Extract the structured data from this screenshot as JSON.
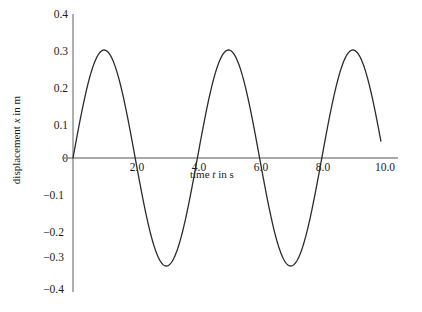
{
  "chart_data": {
    "type": "line",
    "title": "",
    "xlabel": "time t in s",
    "ylabel": "displacement x in m",
    "xlim": [
      0,
      10.4
    ],
    "ylim": [
      -0.4,
      0.4
    ],
    "grid": false,
    "legend": "none",
    "x_ticks": [
      "2.0",
      "4.0",
      "6.0",
      "8.0",
      "10.0"
    ],
    "x_tick_values": [
      2.0,
      4.0,
      6.0,
      8.0,
      10.0
    ],
    "y_ticks": [
      "0.4",
      "0.3",
      "0.2",
      "0.1",
      "0",
      "−0.1",
      "−0.2",
      "−0.3",
      "−0.4"
    ],
    "y_tick_values": [
      0.4,
      0.3,
      0.2,
      0.1,
      0,
      -0.1,
      -0.2,
      -0.3,
      -0.4
    ],
    "series": [
      {
        "name": "displacement",
        "amplitude": 0.3,
        "period": 4.0,
        "equation": "x = 0.3 sin(2πt/4)",
        "x": [
          0.0,
          0.25,
          0.5,
          0.75,
          1.0,
          1.25,
          1.5,
          1.75,
          2.0,
          2.25,
          2.5,
          2.75,
          3.0,
          3.25,
          3.5,
          3.75,
          4.0,
          4.25,
          4.5,
          4.75,
          5.0,
          5.25,
          5.5,
          5.75,
          6.0,
          6.25,
          6.5,
          6.75,
          7.0,
          7.25,
          7.5,
          7.75,
          8.0,
          8.25,
          8.5,
          8.75,
          9.0,
          9.25,
          9.5,
          9.75,
          9.9
        ],
        "values": [
          0.0,
          0.115,
          0.212,
          0.277,
          0.3,
          0.277,
          0.212,
          0.115,
          0.0,
          -0.115,
          -0.212,
          -0.277,
          -0.3,
          -0.277,
          -0.212,
          -0.115,
          0.0,
          0.115,
          0.212,
          0.277,
          0.3,
          0.277,
          0.212,
          0.115,
          0.0,
          -0.115,
          -0.212,
          -0.277,
          -0.3,
          -0.277,
          -0.212,
          -0.115,
          0.0,
          0.115,
          0.212,
          0.277,
          0.3,
          0.277,
          0.212,
          0.115,
          0.047
        ]
      }
    ],
    "maxima": [
      {
        "t": 1.0,
        "x": 0.3
      },
      {
        "t": 5.0,
        "x": 0.3
      },
      {
        "t": 9.0,
        "x": 0.3
      }
    ],
    "minima": [
      {
        "t": 3.0,
        "x": -0.3
      },
      {
        "t": 7.0,
        "x": -0.3
      }
    ],
    "zero_crossings": [
      0.0,
      2.0,
      4.0,
      6.0,
      8.0
    ],
    "colors": {
      "line": "#2b2b2b",
      "axis": "#888888",
      "text": "#1a1a1a",
      "background": "#ffffff"
    }
  }
}
